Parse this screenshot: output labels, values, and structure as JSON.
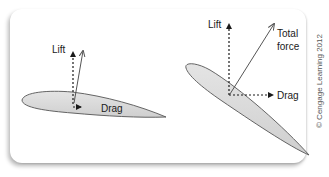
{
  "diagram": {
    "left_panel": {
      "labels": {
        "lift": "Lift",
        "drag": "Drag"
      }
    },
    "right_panel": {
      "labels": {
        "lift": "Lift",
        "total_force_line1": "Total",
        "total_force_line2": "force",
        "drag": "Drag"
      }
    },
    "credit": "© Cengage Learning 2012",
    "colors": {
      "airfoil_fill": "#d9d9d9",
      "airfoil_stroke": "#555555",
      "arrow": "#1a1a1a",
      "total_force": "#555555"
    }
  }
}
